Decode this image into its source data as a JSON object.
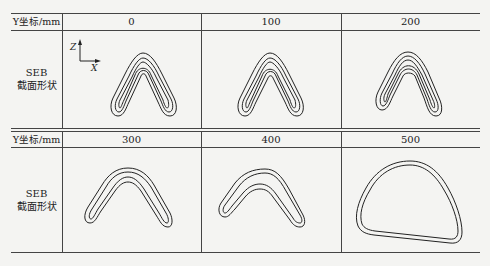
{
  "table": {
    "row_header_label": "Y坐标/mm",
    "row_label_line1": "SEB",
    "row_label_line2": "截面形状",
    "axis_labels": {
      "vertical": "Z",
      "horizontal": "X"
    },
    "rows": [
      {
        "y_values": [
          "0",
          "100",
          "200"
        ]
      },
      {
        "y_values": [
          "300",
          "400",
          "500"
        ]
      }
    ]
  }
}
